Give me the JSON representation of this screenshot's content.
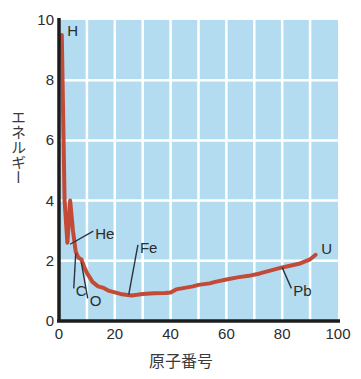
{
  "chart_data": {
    "type": "line",
    "title": "",
    "subtitle": "",
    "xlabel": "原子番号",
    "ylabel": "エネルギー",
    "xlim": [
      0,
      100
    ],
    "ylim": [
      0,
      10
    ],
    "xticks": [
      0,
      20,
      40,
      60,
      80,
      100
    ],
    "yticks": [
      0,
      2,
      4,
      6,
      8,
      10
    ],
    "xtick_labels": [
      "0",
      "20",
      "40",
      "60",
      "80",
      "100"
    ],
    "ytick_labels": [
      "0",
      "2",
      "4",
      "6",
      "8",
      "10"
    ],
    "grid": true,
    "grid_color": "#ffffff",
    "grid_x_step": 10,
    "grid_y_step": 2,
    "plot_bg": "#b4dcf0",
    "axis_color": "#1c1c1c",
    "legend": "none",
    "series": [
      {
        "name": "binding-energy-curve",
        "color": "#c24a36",
        "x": [
          1,
          2,
          3,
          4,
          5,
          6,
          7,
          8,
          9,
          10,
          11,
          12,
          14,
          16,
          18,
          20,
          22,
          24,
          26,
          28,
          30,
          34,
          38,
          40,
          42,
          45,
          48,
          50,
          54,
          56,
          60,
          64,
          68,
          72,
          76,
          80,
          82,
          86,
          90,
          92
        ],
        "y": [
          9.5,
          4.0,
          2.6,
          4.0,
          3.0,
          2.3,
          2.1,
          2.05,
          1.8,
          1.6,
          1.45,
          1.3,
          1.15,
          1.1,
          1.0,
          0.95,
          0.9,
          0.87,
          0.85,
          0.87,
          0.9,
          0.92,
          0.93,
          0.95,
          1.05,
          1.1,
          1.15,
          1.2,
          1.25,
          1.3,
          1.38,
          1.45,
          1.5,
          1.58,
          1.68,
          1.78,
          1.82,
          1.9,
          2.05,
          2.2
        ]
      }
    ],
    "annotations": [
      {
        "label": "H",
        "label_x": 3,
        "label_y": 9.6,
        "leader": false
      },
      {
        "label": "He",
        "label_x": 13,
        "label_y": 2.85,
        "point_x": 4,
        "point_y": 2.55,
        "leader": true
      },
      {
        "label": "C",
        "label_x": 6,
        "label_y": 0.95,
        "point_x": 6,
        "point_y": 2.25,
        "leader": true
      },
      {
        "label": "O",
        "label_x": 11,
        "label_y": 0.62,
        "point_x": 8,
        "point_y": 1.95,
        "leader": true
      },
      {
        "label": "Fe",
        "label_x": 29,
        "label_y": 2.4,
        "point_x": 25,
        "point_y": 0.88,
        "leader": true
      },
      {
        "label": "Pb",
        "label_x": 84,
        "label_y": 0.95,
        "point_x": 80,
        "point_y": 1.78,
        "leader": true
      },
      {
        "label": "U",
        "label_x": 94,
        "label_y": 2.35,
        "leader": false
      }
    ]
  },
  "axes": {
    "ylabel_text": "エネルギー",
    "xlabel_text": "原子番号"
  }
}
